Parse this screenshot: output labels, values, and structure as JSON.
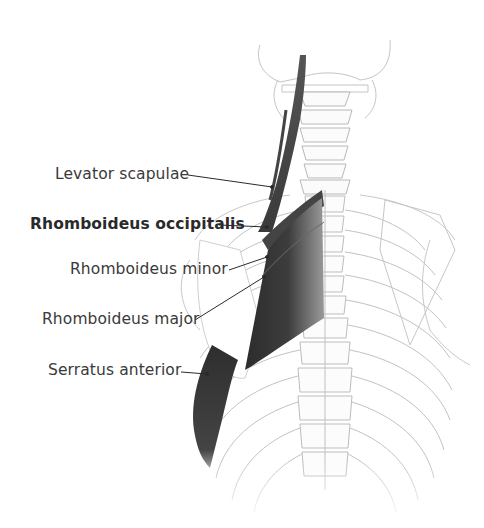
{
  "figure": {
    "labels": [
      {
        "id": "levator",
        "text": "Levator scapulae",
        "bold": false
      },
      {
        "id": "occipitalis",
        "text": "Rhomboideus occipitalis",
        "bold": true
      },
      {
        "id": "minor",
        "text": "Rhomboideus minor",
        "bold": false
      },
      {
        "id": "major",
        "text": "Rhomboideus major",
        "bold": false
      },
      {
        "id": "serratus",
        "text": "Serratus anterior",
        "bold": false
      }
    ],
    "colors": {
      "background": "#ffffff",
      "muscle": "#3b3b3b",
      "bone_outline": "#b8b8b8",
      "label_text": "#3a3a3a",
      "leader_line": "#2b2b2b"
    }
  }
}
